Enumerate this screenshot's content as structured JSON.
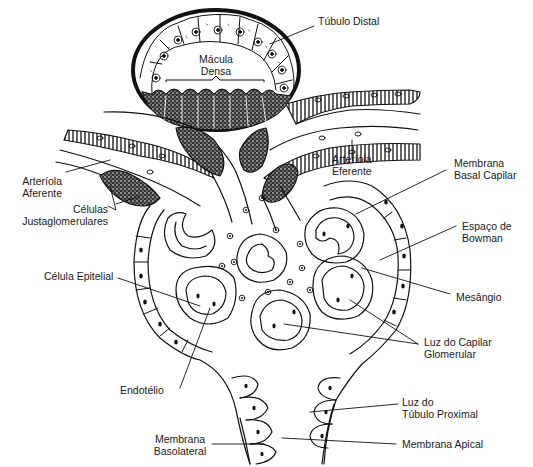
{
  "figure": {
    "colors": {
      "ink": "#111111",
      "background": "#ffffff",
      "label": "#1a1a1a"
    }
  },
  "labels": {
    "tubulo_distal": {
      "line1": "Túbulo Distal"
    },
    "macula_densa": {
      "line1": "Mácula",
      "line2": "Densa"
    },
    "arteriola_aferente": {
      "line1": "Arteríola",
      "line2": "Aferente"
    },
    "celulas_justaglomerulares": {
      "line1": "Células",
      "line2": "Justaglomerulares"
    },
    "arteriola_eferente": {
      "line1": "Arteríola",
      "line2": "Eferente"
    },
    "membrana_basal_capilar": {
      "line1": "Membrana",
      "line2": "Basal Capilar"
    },
    "espaco_de_bowman": {
      "line1": "Espaço de",
      "line2": "Bowman"
    },
    "celula_epitelial": {
      "line1": "Célula Epitelial"
    },
    "mesangio": {
      "line1": "Mesângio"
    },
    "luz_do_capilar_glomerular": {
      "line1": "Luz do Capilar",
      "line2": "Glomerular"
    },
    "endotelio": {
      "line1": "Endotélio"
    },
    "luz_do_tubulo_proximal": {
      "line1": "Luz do",
      "line2": "Túbulo Proximal"
    },
    "membrana_basolateral": {
      "line1": "Membrana",
      "line2": "Basolateral"
    },
    "membrana_apical": {
      "line1": "Membrana Apical"
    }
  }
}
